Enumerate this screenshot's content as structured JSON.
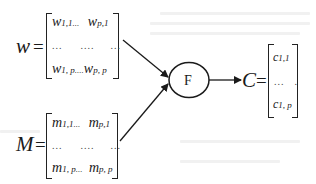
{
  "diagram": {
    "w_matrix": {
      "symbol": "w",
      "equals": "=",
      "row1": {
        "a": "w",
        "a_sub": "1,1",
        "mid": "...",
        "b": "w",
        "b_sub": "p,1"
      },
      "row2": {
        "d1": "...",
        "d2": "....",
        "d3": "..."
      },
      "row3": {
        "a": "w",
        "a_sub": "1, p",
        "mid": "....",
        "b": "w",
        "b_sub": "p, p"
      }
    },
    "m_matrix": {
      "symbol": "M",
      "equals": "=",
      "row1": {
        "a": "m",
        "a_sub": "1,1",
        "mid": "...",
        "b": "m",
        "b_sub": "p,1"
      },
      "row2": {
        "d1": "...",
        "d2": "....",
        "d3": "..."
      },
      "row3": {
        "a": "m",
        "a_sub": "1, p",
        "mid": "...",
        "b": "m",
        "b_sub": "p, p"
      }
    },
    "function_node": {
      "label": "F"
    },
    "c_matrix": {
      "symbol": "C",
      "equals": "=",
      "row1": {
        "a": "c",
        "a_sub": "1,1"
      },
      "row2": {
        "d1": "...",
        "d2": "."
      },
      "row3": {
        "a": "c",
        "a_sub": "1, p"
      }
    },
    "edges": [
      {
        "from": "w_matrix",
        "to": "function_node"
      },
      {
        "from": "m_matrix",
        "to": "function_node"
      },
      {
        "from": "function_node",
        "to": "c_matrix"
      }
    ],
    "colors": {
      "ink": "#1a1a1a",
      "background": "#ffffff",
      "bleed_text": "#f1f1f1"
    }
  }
}
